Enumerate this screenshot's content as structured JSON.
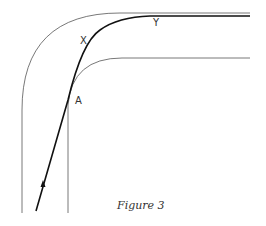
{
  "labels": {
    "x": "X",
    "y": "Y",
    "a": "A"
  },
  "caption": "Figure 3"
}
